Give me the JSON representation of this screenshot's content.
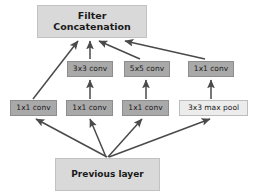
{
  "diagram": {
    "colors": {
      "box_light": "#d9d9d9",
      "box_mid": "#a9a9a9",
      "box_pale": "#ececec",
      "arrow": "#4a4a4a",
      "background": "#ffffff",
      "text": "#1a1a1a"
    },
    "nodes": {
      "concat": {
        "label": "Filter\nConcatenation"
      },
      "conv3x3": {
        "label": "3x3 conv"
      },
      "conv5x5": {
        "label": "5x5 conv"
      },
      "conv1x1_top": {
        "label": "1x1 conv"
      },
      "conv1x1_a": {
        "label": "1x1 conv"
      },
      "conv1x1_b": {
        "label": "1x1 conv"
      },
      "conv1x1_c": {
        "label": "1x1 conv"
      },
      "maxpool3x3": {
        "label": "3x3 max pool"
      },
      "previous": {
        "label": "Previous layer"
      }
    }
  }
}
